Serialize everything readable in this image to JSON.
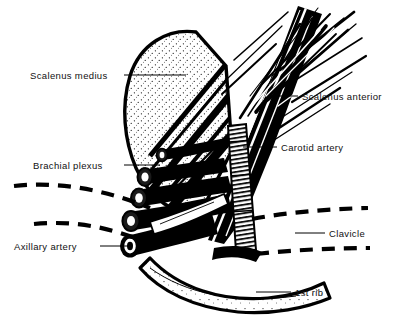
{
  "figure": {
    "background_color": "#ffffff",
    "ink_color": "#000000",
    "width": 396,
    "height": 322
  },
  "labels": [
    {
      "id": "scalenus-medius",
      "text": "Scalenus medius",
      "side": "left",
      "x": 30,
      "y": 71,
      "leader": {
        "x1": 124,
        "y1": 75,
        "x2": 186,
        "y2": 75
      }
    },
    {
      "id": "brachial-plexus",
      "text": "Brachial plexus",
      "side": "left",
      "x": 33,
      "y": 161,
      "leader": {
        "x1": 124,
        "y1": 165,
        "x2": 160,
        "y2": 165
      }
    },
    {
      "id": "axillary-artery",
      "text": "Axillary artery",
      "side": "left",
      "x": 14,
      "y": 242,
      "leader": {
        "x1": 100,
        "y1": 246,
        "x2": 128,
        "y2": 246
      }
    },
    {
      "id": "scalenus-anterior",
      "text": "Scalenus anterior",
      "side": "right",
      "x": 302,
      "y": 92,
      "leader": {
        "x1": 268,
        "y1": 96,
        "x2": 298,
        "y2": 96
      }
    },
    {
      "id": "carotid-artery",
      "text": "Carotid artery",
      "side": "right",
      "x": 281,
      "y": 143,
      "leader": {
        "x1": 243,
        "y1": 147,
        "x2": 277,
        "y2": 147
      }
    },
    {
      "id": "clavicle",
      "text": "Clavicle",
      "side": "right",
      "x": 329,
      "y": 229,
      "leader": {
        "x1": 295,
        "y1": 233,
        "x2": 325,
        "y2": 233
      }
    },
    {
      "id": "first-rib",
      "text": "1st rib",
      "side": "right",
      "x": 295,
      "y": 288,
      "leader": {
        "x1": 256,
        "y1": 292,
        "x2": 291,
        "y2": 292
      }
    }
  ],
  "dashed_outlines": [
    {
      "id": "clavicle-upper-left",
      "path": "M 14 186 C 60 181, 106 190, 150 208"
    },
    {
      "id": "clavicle-lower-left",
      "path": "M 34 224 C 76 220, 112 228, 148 243"
    },
    {
      "id": "clavicle-upper-right",
      "path": "M 252 219 C 290 212, 328 209, 368 208"
    },
    {
      "id": "clavicle-lower-right",
      "path": "M 256 254 C 294 250, 332 248, 370 248"
    }
  ],
  "structures": [
    {
      "id": "scalenus-medius-belly",
      "name": "Scalenus medius",
      "style": "domed muscle belly, thick outline, stippled interior"
    },
    {
      "id": "scalenus-anterior-belly",
      "name": "Scalenus anterior",
      "style": "long fibrous muscle, brush-stroke fibers running upper-right to lower-left"
    },
    {
      "id": "brachial-plexus-trunks",
      "name": "Brachial plexus",
      "style": "bundle of cylindrical nerve trunks with cut elliptical ends"
    },
    {
      "id": "axillary-artery-vessel",
      "name": "Axillary artery",
      "style": "tubular vessel with open circular lumen at cut end"
    },
    {
      "id": "carotid-artery-vessel",
      "name": "Carotid artery",
      "style": "narrow vertical band with horizontal striations"
    },
    {
      "id": "first-rib-body",
      "name": "1st rib",
      "style": "crescent band, stippled, thick black border"
    }
  ]
}
